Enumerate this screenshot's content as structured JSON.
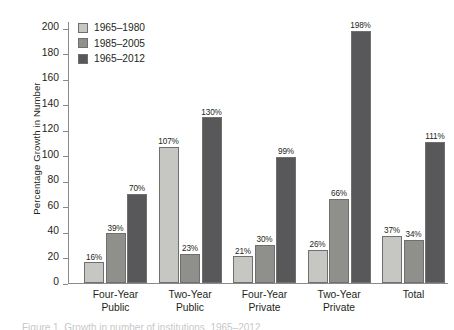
{
  "chart_data": {
    "type": "bar",
    "title": "",
    "xlabel": "",
    "ylabel": "Percentage Growth in Number",
    "ylim": [
      0,
      205
    ],
    "yticks": [
      0,
      20,
      40,
      60,
      80,
      100,
      120,
      140,
      160,
      180,
      200
    ],
    "ytick_labels": [
      "0",
      "20",
      "40",
      "60",
      "80",
      "100",
      "120",
      "140",
      "160",
      "180",
      "200"
    ],
    "grid": false,
    "legend_position": "upper-left-inside",
    "categories": [
      "Four-Year\nPublic",
      "Two-Year\nPublic",
      "Four-Year\nPrivate",
      "Two-Year\nPrivate",
      "Total"
    ],
    "category_lines": [
      [
        "Four-Year",
        "Public"
      ],
      [
        "Two-Year",
        "Public"
      ],
      [
        "Four-Year",
        "Private"
      ],
      [
        "Two-Year",
        "Private"
      ],
      [
        "Total",
        ""
      ]
    ],
    "series": [
      {
        "name": "1965–1980",
        "color": "#c6c6c3",
        "values": [
          16,
          107,
          21,
          26,
          37
        ],
        "labels": [
          "16%",
          "107%",
          "21%",
          "26%",
          "37%"
        ]
      },
      {
        "name": "1985–2005",
        "color": "#8f8f8c",
        "values": [
          39,
          23,
          30,
          66,
          34
        ],
        "labels": [
          "39%",
          "23%",
          "30%",
          "66%",
          "34%"
        ]
      },
      {
        "name": "1965–2012",
        "color": "#58585a",
        "values": [
          70,
          130,
          99,
          198,
          111
        ],
        "labels": [
          "70%",
          "130%",
          "99%",
          "198%",
          "111%"
        ]
      }
    ]
  },
  "legend": {
    "items": [
      {
        "label": "1965–1980",
        "swatch": "light-gray-swatch"
      },
      {
        "label": "1985–2005",
        "swatch": "medium-gray-swatch"
      },
      {
        "label": "1965–2012",
        "swatch": "dark-gray-swatch"
      }
    ]
  },
  "caption": {
    "text": "Figure 1. Growth in number of institutions, 1965–2012"
  },
  "colors": {
    "series_1": "#c6c6c3",
    "series_2": "#8f8f8c",
    "series_3": "#58585a",
    "axis": "#8a8a8a",
    "text": "#231f20",
    "background": "#ffffff",
    "bar_outline": "#6f6f6f"
  }
}
